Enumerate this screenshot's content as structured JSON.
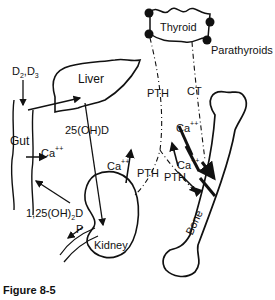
{
  "diagram": {
    "caption": "Figure 8-5",
    "organs": {
      "liver": "Liver",
      "gut": "Gut",
      "kidney": "Kidney",
      "bone": "Bone",
      "thyroid": "Thyroid",
      "parathyroids": "Parathyroids"
    },
    "labels": {
      "vitamin_d_base": "D",
      "vitamin_d_sub2": "2",
      "vitamin_d_sep": ",D",
      "vitamin_d_sub3": "3",
      "hydroxy_d": "25(OH)D",
      "calcitriol_pre": "1,25(OH)",
      "calcitriol_sub": "2",
      "calcitriol_post": "D",
      "calcium": "Ca",
      "calcium_charge": "++",
      "phosphate": "P",
      "pth": "PTH",
      "ct": "CT"
    },
    "edges": [
      {
        "from": "D2,D3",
        "to": "Gut"
      },
      {
        "from": "Gut",
        "to": "Liver"
      },
      {
        "from": "Liver",
        "to": "Kidney",
        "label": "25(OH)D"
      },
      {
        "from": "Kidney",
        "to": "Gut",
        "label": "1,25(OH)2D"
      },
      {
        "from": "Gut",
        "to": "Blood",
        "label": "Ca++"
      },
      {
        "from": "Kidney",
        "to": "Blood",
        "label": "Ca++"
      },
      {
        "from": "Kidney",
        "to": "Urine",
        "label": "P"
      },
      {
        "from": "Parathyroids",
        "to": "Kidney",
        "label": "PTH"
      },
      {
        "from": "Parathyroids",
        "to": "Bone",
        "label": "PTH"
      },
      {
        "from": "Thyroid",
        "to": "Bone",
        "label": "CT"
      },
      {
        "from": "Bone",
        "to": "Blood",
        "label": "Ca++"
      }
    ]
  }
}
